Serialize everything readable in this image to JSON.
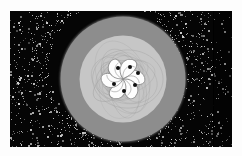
{
  "figure": {
    "title": "",
    "background_color": "#ffffff",
    "plot_frame": {
      "x": 10,
      "y": 11,
      "width": 222,
      "height": 136
    }
  },
  "colors": {
    "background": "#ffffff",
    "chaotic_sea": "#050505",
    "noise_speck": "#9a9a9a",
    "outer_disc": "#8d8d8d",
    "inner_disc": "#c6c6c6",
    "core": "#fdfdfd",
    "curve_tracery": "#7d7d7d",
    "fixed_point": "#101010"
  },
  "chart_data": {
    "type": "scatter",
    "title": "",
    "subtitle": "",
    "xlabel": "",
    "ylabel": "",
    "xlim": [
      -1,
      1
    ],
    "ylim": [
      -1,
      1
    ],
    "grid": false,
    "legend": "none",
    "center": {
      "x": 113,
      "y": 68
    },
    "regions": [
      {
        "name": "chaotic-sea",
        "fill": "#050505",
        "description": "dense stochastic scatter of orbit points filling the frame",
        "point_count": 1400
      },
      {
        "name": "outer-resonance-disc",
        "fill": "#8d8d8d",
        "shape": "circle",
        "radius": 62.5
      },
      {
        "name": "inner-regular-disc",
        "fill": "#c6c6c6",
        "shape": "circle",
        "radius": 43.5
      },
      {
        "name": "core-island-chain",
        "fill": "#fdfdfd",
        "shape": "pinwheel",
        "radius": 24,
        "arms": 6
      }
    ],
    "series": [
      {
        "name": "elliptic-fixed-points",
        "marker": "filled-circle",
        "color": "#101010",
        "size": 3.2,
        "points": [
          {
            "x": 108,
            "y": 57
          },
          {
            "x": 120,
            "y": 56
          },
          {
            "x": 128,
            "y": 62
          },
          {
            "x": 125,
            "y": 74
          },
          {
            "x": 114,
            "y": 80
          },
          {
            "x": 104,
            "y": 73
          }
        ]
      }
    ],
    "annotations": [
      {
        "name": "sampling-seam",
        "type": "vertical-line",
        "x": 213,
        "color": "#000000"
      }
    ]
  }
}
